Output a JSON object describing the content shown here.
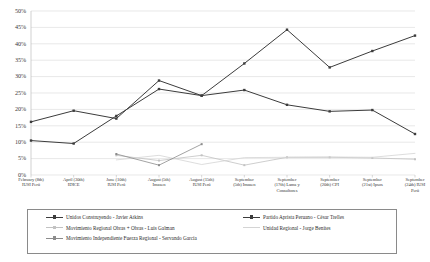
{
  "chart_data": {
    "type": "line",
    "title": "",
    "xlabel": "",
    "ylabel": "",
    "ylim": [
      0,
      50
    ],
    "ytick_labels": [
      "0%",
      "5%",
      "10%",
      "15%",
      "20%",
      "25%",
      "30%",
      "35%",
      "40%",
      "45%",
      "50%"
    ],
    "ytick_values": [
      0,
      5,
      10,
      15,
      20,
      25,
      30,
      35,
      40,
      45,
      50
    ],
    "grid": true,
    "legend_position": "bottom",
    "categories": [
      "February (8th) IUSI Perú",
      "April (30th) IDICE",
      "June (10th) IUSI Perú",
      "August (5th) Imasen",
      "August (15th) IUSI Perú",
      "September (5th) Imasen",
      "September (17th) Lama y Consultores",
      "September (20th) CPI",
      "September (21st) Ipsos",
      "September (24th) IUSI Perú"
    ],
    "categories_lines": [
      [
        "February (8th)",
        "IUSI Perú"
      ],
      [
        "April (30th)",
        "IDICE"
      ],
      [
        "June (10th)",
        "IUSI Perú"
      ],
      [
        "August (5th)",
        "Imasen"
      ],
      [
        "August (15th)",
        "IUSI Perú"
      ],
      [
        "September",
        "(5th) Imasen"
      ],
      [
        "September",
        "(17th) Lama y",
        "Consultores"
      ],
      [
        "September",
        "(20th) CPI"
      ],
      [
        "September",
        "(21st) Ipsos"
      ],
      [
        "September",
        "(24th) IUSI",
        "Perú"
      ]
    ],
    "series": [
      {
        "name": "Unidos Construyendo - Javier Atkins",
        "color": "#3c3c3c",
        "marker": "square",
        "values": [
          10.5,
          9.6,
          18.0,
          26.2,
          24.2,
          34.0,
          44.3,
          32.8,
          37.8,
          42.5
        ]
      },
      {
        "name": "Partido Aprista Peruano - César Trelles",
        "color": "#3c3c3c",
        "marker": "square",
        "values": [
          16.2,
          19.6,
          17.2,
          28.8,
          24.2,
          25.9,
          21.4,
          19.4,
          19.8,
          12.5
        ]
      },
      {
        "name": "Movimiento Regional Obras + Obras - Luis Galman",
        "color": "#c2c2c2",
        "marker": "square",
        "values": [
          null,
          null,
          6.0,
          4.4,
          6.0,
          3.0,
          5.4,
          5.4,
          5.2,
          4.8
        ]
      },
      {
        "name": "Unidad Regional - Jorge Benites",
        "color": "#d4d4d4",
        "marker": "none",
        "values": [
          null,
          null,
          4.6,
          6.0,
          3.2,
          5.3,
          5.4,
          5.5,
          5.4,
          6.6
        ]
      },
      {
        "name": "Movimiento Independiente Fuerza Regional - Servando García",
        "color": "#8c8c8c",
        "marker": "square",
        "values": [
          null,
          null,
          6.4,
          3.0,
          9.4,
          null,
          null,
          null,
          null,
          null
        ]
      }
    ]
  },
  "legend": {
    "entries": [
      {
        "label": "Unidos Construyendo - Javier Atkins",
        "color": "#3c3c3c",
        "marker": "square",
        "col": 0,
        "row": 0
      },
      {
        "label": "Partido Aprista Peruano - César Trelles",
        "color": "#3c3c3c",
        "marker": "square",
        "col": 1,
        "row": 0
      },
      {
        "label": "Movimiento Regional Obras + Obras - Luis Galman",
        "color": "#c2c2c2",
        "marker": "square",
        "col": 0,
        "row": 1
      },
      {
        "label": "Unidad Regional - Jorge Benites",
        "color": "#d4d4d4",
        "marker": "none",
        "col": 1,
        "row": 1
      },
      {
        "label": "Movimiento Independiente Fuerza Regional - Servando García",
        "color": "#8c8c8c",
        "marker": "square",
        "col": 0,
        "row": 2
      }
    ]
  },
  "colors": {
    "grid": "#d9d9d9",
    "axis": "#bdbdbd",
    "text": "#3a3a3a",
    "background": "#ffffff"
  }
}
